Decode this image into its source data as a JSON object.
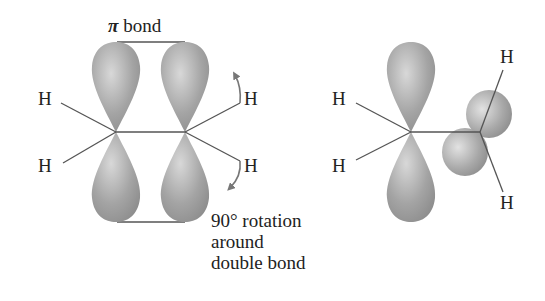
{
  "diagram": {
    "left_structure": {
      "pi_bond_label_symbol": "π",
      "pi_bond_label_text": "bond",
      "atoms": [
        "H",
        "H",
        "H",
        "H"
      ]
    },
    "rotation_caption": {
      "line1": "90° rotation",
      "line2": "around",
      "line3": "double bond"
    },
    "right_structure": {
      "atoms": [
        "H",
        "H",
        "H",
        "H"
      ]
    },
    "colors": {
      "orbital_fill": "#9a9a9a",
      "orbital_highlight": "#d6d6d6",
      "bond_line": "#555555",
      "arrow": "#777777",
      "text": "#222222"
    }
  }
}
